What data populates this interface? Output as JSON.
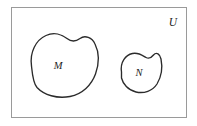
{
  "figure": {
    "type": "venn-diagram",
    "background_color": "#ffffff",
    "stroke_color": "#2b2b2b",
    "border_color": "#9a9a9a"
  },
  "universe": {
    "label": "U",
    "label_position": "top-right-inside",
    "rect": {
      "x": 11,
      "y": 7,
      "width": 176,
      "height": 111
    }
  },
  "sets": [
    {
      "id": "set-m",
      "label": "M",
      "label_x": 58,
      "label_y": 69,
      "bounds": {
        "x": 28,
        "y": 33,
        "width": 70,
        "height": 64
      },
      "path": "M 31.5 66 C 29.5 52 36 40 46 35.5 C 54 31.8 62 34.5 67 38.5 C 72 42.5 76 41.5 80 38.5 C 85 34.8 92 37.5 95 44 C 99.5 53 99 64 95.5 74 C 91.5 85 82.5 94 70 96.5 C 57 99 44 95 37 87.5 C 33 83 32.3 74 31.5 66 Z"
    },
    {
      "id": "set-n",
      "label": "N",
      "label_x": 139,
      "label_y": 76,
      "bounds": {
        "x": 119,
        "y": 52,
        "width": 43,
        "height": 41
      },
      "path": "M 121.5 72 C 120 62 125.5 55 132.5 53.5 C 138.5 52.2 142.5 55.5 146 57.5 C 149 59.2 151.5 57.5 153.5 55 C 156.5 51.5 160 54 161 59 C 162.5 66.5 161.5 76.5 157 84 C 152.5 91 144 93.8 136 92 C 128 90.2 123 84 121.5 78 Z"
    }
  ],
  "disjoint": true
}
